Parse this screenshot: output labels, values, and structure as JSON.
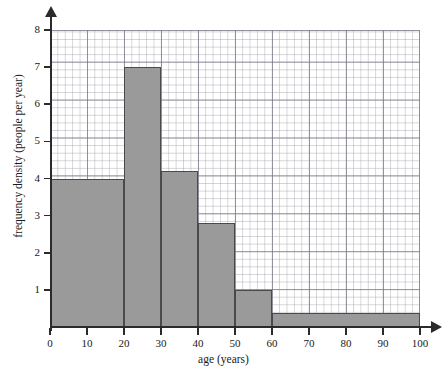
{
  "chart_data": {
    "type": "bar",
    "title": "",
    "xlabel": "age (years)",
    "ylabel": "frequency density (people per year)",
    "xlim": [
      0,
      100
    ],
    "ylim": [
      0,
      8
    ],
    "grid": true,
    "legend": "none",
    "xticks": [
      "0",
      "10",
      "20",
      "30",
      "40",
      "50",
      "60",
      "70",
      "80",
      "90",
      "100"
    ],
    "xtick_values": [
      0,
      10,
      20,
      30,
      40,
      50,
      60,
      70,
      80,
      90,
      100
    ],
    "yticks": [
      "1",
      "2",
      "3",
      "4",
      "5",
      "6",
      "7",
      "8"
    ],
    "ytick_values": [
      1,
      2,
      3,
      4,
      5,
      6,
      7,
      8
    ],
    "bars": [
      {
        "label": "0-20",
        "x0": 0,
        "x1": 20,
        "value": 4.0
      },
      {
        "label": "20-30",
        "x0": 20,
        "x1": 30,
        "value": 7.0
      },
      {
        "label": "30-40",
        "x0": 30,
        "x1": 40,
        "value": 4.2
      },
      {
        "label": "40-50",
        "x0": 40,
        "x1": 50,
        "value": 2.8
      },
      {
        "label": "50-60",
        "x0": 50,
        "x1": 60,
        "value": 1.0
      },
      {
        "label": "60-100",
        "x0": 60,
        "x1": 100,
        "value": 0.37
      }
    ],
    "bar_fill": "#9a9a9a",
    "bar_edge": "#4a4a4a"
  }
}
